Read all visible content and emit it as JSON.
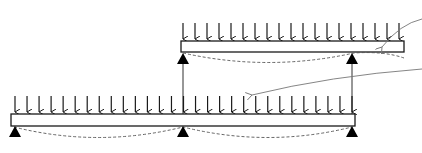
{
  "diagram": {
    "type": "structural-beam-schematic",
    "colors": {
      "line": "#1a1a1a",
      "beam_fill": "#ffffff",
      "support": "#000000",
      "deflection": "#555555",
      "pointer": "#777777"
    },
    "upper_beam": {
      "load_arrow_count": 19,
      "support_count": 2,
      "has_deflection_curve": true
    },
    "lower_beam": {
      "load_arrow_count": 29,
      "support_count": 3,
      "has_deflection_curve": true
    },
    "connectors": 2,
    "pointer_arrows": 2,
    "labels": []
  }
}
